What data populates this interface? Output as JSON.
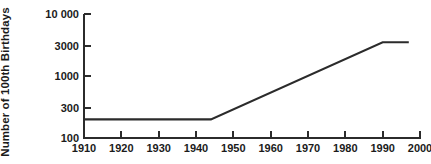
{
  "chart_data": {
    "type": "line",
    "title": "",
    "xlabel": "",
    "ylabel": "Number of 100th Birthdays",
    "yscale": "log",
    "xlim": [
      1910,
      2000
    ],
    "ylim": [
      100,
      10000
    ],
    "grid": false,
    "legend": null,
    "x_ticks": [
      1910,
      1920,
      1930,
      1940,
      1950,
      1960,
      1970,
      1980,
      1990,
      2000
    ],
    "x_tick_labels": [
      "1910",
      "1920",
      "1930",
      "1940",
      "1950",
      "1960",
      "1970",
      "1980",
      "1990",
      "2000"
    ],
    "y_ticks": [
      100,
      300,
      1000,
      3000,
      10000
    ],
    "y_tick_labels": [
      "100",
      "300",
      "1000",
      "3000",
      "10 000"
    ],
    "series": [
      {
        "name": "Number of 100th Birthdays",
        "color": "#2b2b2b",
        "line_width": 2,
        "x": [
          1910,
          1944,
          1990,
          1997
        ],
        "values": [
          200,
          200,
          3500,
          3500
        ]
      }
    ],
    "annotations": []
  },
  "figure": {
    "background_color": "#ffffff",
    "axis_color": "#2b2b2b",
    "text_color": "#1b1b1b"
  }
}
